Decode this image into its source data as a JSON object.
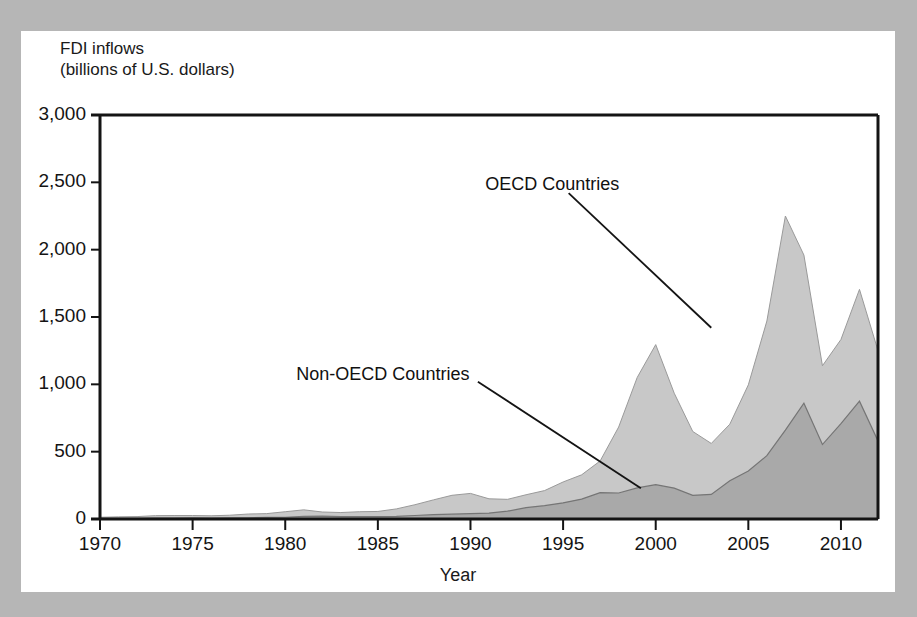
{
  "figure": {
    "card_background": "#ffffff",
    "page_background": "#b6b6b6"
  },
  "chart_data": {
    "type": "area",
    "stacked": true,
    "title": "",
    "subtitle": "",
    "ylabel_lines": [
      "FDI inflows",
      "(billions of U.S. dollars)"
    ],
    "ylabel": "FDI inflows (billions of U.S. dollars)",
    "xlabel": "Year",
    "xlim": [
      1970,
      2012
    ],
    "ylim": [
      0,
      3000
    ],
    "ytick_values": [
      0,
      500,
      1000,
      1500,
      2000,
      2500,
      3000
    ],
    "ytick_labels": [
      "0",
      "500",
      "1,000",
      "1,500",
      "2,000",
      "2,500",
      "3,000"
    ],
    "xtick_values": [
      1970,
      1975,
      1980,
      1985,
      1990,
      1995,
      2000,
      2005,
      2010
    ],
    "xtick_labels": [
      "1970",
      "1975",
      "1980",
      "1985",
      "1990",
      "1995",
      "2000",
      "2005",
      "2010"
    ],
    "grid": false,
    "legend_position": "inline-annotations",
    "colors": {
      "oecd_fill": "#c8c8c8",
      "non_oecd_fill": "#a9a9a9",
      "series_outline": "#6e6e6e",
      "axis": "#141414",
      "annotation_leader": "#141414"
    },
    "x": [
      1970,
      1971,
      1972,
      1973,
      1974,
      1975,
      1976,
      1977,
      1978,
      1979,
      1980,
      1981,
      1982,
      1983,
      1984,
      1985,
      1986,
      1987,
      1988,
      1989,
      1990,
      1991,
      1992,
      1993,
      1994,
      1995,
      1996,
      1997,
      1998,
      1999,
      2000,
      2001,
      2002,
      2003,
      2004,
      2005,
      2006,
      2007,
      2008,
      2009,
      2010,
      2011,
      2012
    ],
    "series": [
      {
        "name": "Non-OECD Countries",
        "fill": "#a9a9a9",
        "values": [
          4,
          4,
          5,
          7,
          6,
          8,
          7,
          8,
          9,
          12,
          13,
          20,
          22,
          18,
          18,
          18,
          20,
          26,
          32,
          36,
          40,
          44,
          58,
          84,
          99,
          120,
          148,
          196,
          193,
          231,
          255,
          229,
          175,
          183,
          284,
          356,
          470,
          660,
          860,
          553,
          708,
          875,
          580
        ]
      },
      {
        "name": "OECD Countries",
        "fill": "#c8c8c8",
        "values": [
          9,
          12,
          13,
          18,
          20,
          18,
          17,
          20,
          28,
          28,
          41,
          48,
          30,
          30,
          36,
          38,
          55,
          80,
          110,
          140,
          150,
          106,
          88,
          96,
          112,
          155,
          180,
          235,
          490,
          820,
          1040,
          705,
          475,
          378,
          420,
          640,
          1000,
          1590,
          1100,
          585,
          625,
          830,
          670
        ]
      }
    ],
    "annotations": [
      {
        "id": "oecd",
        "text": "OECD Countries",
        "label_x": 1990.8,
        "label_y": 2480,
        "leader_from_x": 1995.3,
        "leader_from_y": 2420,
        "leader_to_x": 2003.0,
        "leader_to_y": 1420
      },
      {
        "id": "non-oecd",
        "text": "Non-OECD Countries",
        "label_x": 1980.6,
        "label_y": 1070,
        "leader_from_x": 1990.4,
        "leader_from_y": 1020,
        "leader_to_x": 1999.2,
        "leader_to_y": 228
      }
    ]
  }
}
